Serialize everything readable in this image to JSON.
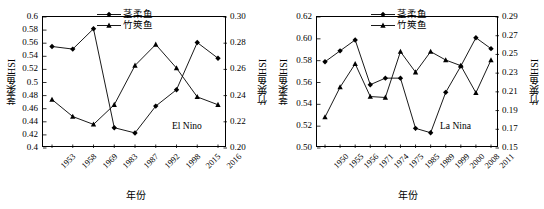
{
  "figure": {
    "series_names": {
      "squid": "茎柔鱼",
      "mackerel": "竹筴鱼"
    }
  },
  "panels": [
    {
      "id": "el-nino",
      "annotation": "El Nino",
      "xlabel": "年份",
      "ylabel_left": "茎柔鱼HSI",
      "ylabel_right": "竹筴鱼HSI",
      "categories": [
        "1953",
        "1958",
        "1969",
        "1983",
        "1987",
        "1992",
        "1998",
        "2015",
        "2016"
      ],
      "yticks_left": [
        "0.4",
        "0.42",
        "0.44",
        "0.46",
        "0.48",
        "0.5",
        "0.52",
        "0.54",
        "0.56",
        "0.58",
        "0.6"
      ],
      "yticks_right": [
        "0.20",
        "0.22",
        "0.24",
        "0.26",
        "0.28",
        "0.30"
      ],
      "legend": [
        "茎柔鱼",
        "竹筴鱼"
      ]
    },
    {
      "id": "la-nina",
      "annotation": "La Nina",
      "xlabel": "年份",
      "ylabel_left": "茎柔鱼HSI",
      "ylabel_right": "竹筴鱼HSI",
      "categories": [
        "1950",
        "1955",
        "1956",
        "1971",
        "1974",
        "1975",
        "1985",
        "1989",
        "1999",
        "2000",
        "2008",
        "2011"
      ],
      "yticks_left": [
        "0.50",
        "0.52",
        "0.54",
        "0.56",
        "0.58",
        "0.60",
        "0.62"
      ],
      "yticks_right": [
        "0.15",
        "0.17",
        "0.19",
        "0.21",
        "0.23",
        "0.25",
        "0.27",
        "0.29"
      ],
      "legend": [
        "茎柔鱼",
        "竹筴鱼"
      ]
    }
  ],
  "chart_data": [
    {
      "type": "line",
      "title": "",
      "annotation": "El Nino",
      "xlabel": "年份",
      "ylabel": "茎柔鱼HSI",
      "ylabel_secondary": "竹筴鱼HSI",
      "categories": [
        "1953",
        "1958",
        "1969",
        "1983",
        "1987",
        "1992",
        "1998",
        "2015",
        "2016"
      ],
      "ylim": [
        0.4,
        0.6
      ],
      "ylim_secondary": [
        0.2,
        0.3
      ],
      "ytick_step": 0.02,
      "ytick_step_secondary": 0.02,
      "grid": false,
      "legend_position": "top-center",
      "series": [
        {
          "name": "茎柔鱼",
          "axis": "left",
          "marker": "diamond",
          "values": [
            0.555,
            0.551,
            0.582,
            0.431,
            0.423,
            0.464,
            0.489,
            0.561,
            0.537
          ]
        },
        {
          "name": "竹筴鱼",
          "axis": "right",
          "marker": "triangle",
          "values": [
            0.237,
            0.224,
            0.218,
            0.233,
            0.263,
            0.279,
            0.261,
            0.239,
            0.233
          ]
        }
      ]
    },
    {
      "type": "line",
      "title": "",
      "annotation": "La Nina",
      "xlabel": "年份",
      "ylabel": "茎柔鱼HSI",
      "ylabel_secondary": "竹筴鱼HSI",
      "categories": [
        "1950",
        "1955",
        "1956",
        "1971",
        "1974",
        "1975",
        "1985",
        "1989",
        "1999",
        "2000",
        "2008",
        "2011"
      ],
      "ylim": [
        0.5,
        0.62
      ],
      "ylim_secondary": [
        0.15,
        0.29
      ],
      "ytick_step": 0.02,
      "ytick_step_secondary": 0.02,
      "grid": false,
      "legend_position": "top-center",
      "series": [
        {
          "name": "茎柔鱼",
          "axis": "left",
          "marker": "diamond",
          "values": [
            0.579,
            0.589,
            0.599,
            0.558,
            0.564,
            0.564,
            0.518,
            0.514,
            0.551,
            0.575,
            0.601,
            0.591
          ]
        },
        {
          "name": "竹筴鱼",
          "axis": "right",
          "marker": "triangle",
          "values": [
            0.183,
            0.215,
            0.24,
            0.205,
            0.204,
            0.253,
            0.231,
            0.253,
            0.244,
            0.238,
            0.209,
            0.244
          ]
        }
      ]
    }
  ]
}
